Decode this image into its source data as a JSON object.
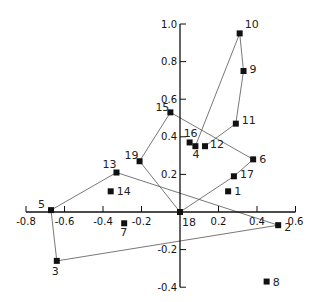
{
  "chart_data": {
    "type": "scatter",
    "title": "",
    "xlabel": "",
    "ylabel": "",
    "xlim": [
      -0.8,
      0.6
    ],
    "ylim": [
      -0.4,
      1.0
    ],
    "grid": false,
    "legend": null,
    "x_ticks": [
      -0.8,
      -0.6,
      -0.4,
      -0.2,
      0.2,
      0.4,
      0.6
    ],
    "x_tick_labels": [
      "-0.8",
      "-0.6",
      "-0.4",
      "-0.2",
      "0.2",
      "0.4",
      "0.6"
    ],
    "y_ticks": [
      1.0,
      0.8,
      0.6,
      0.4,
      0.2,
      -0.2,
      -0.4
    ],
    "y_tick_labels": [
      "1.0",
      "0.8",
      "0.6",
      "0.4",
      "0.2",
      "-0.2",
      "-0.4"
    ],
    "points": [
      {
        "id": "1",
        "x": 0.25,
        "y": 0.11
      },
      {
        "id": "2",
        "x": 0.51,
        "y": -0.07
      },
      {
        "id": "3",
        "x": -0.64,
        "y": -0.26
      },
      {
        "id": "4",
        "x": 0.08,
        "y": 0.35
      },
      {
        "id": "5",
        "x": -0.67,
        "y": 0.01
      },
      {
        "id": "6",
        "x": 0.38,
        "y": 0.28
      },
      {
        "id": "7",
        "x": -0.29,
        "y": -0.06
      },
      {
        "id": "8",
        "x": 0.45,
        "y": -0.37
      },
      {
        "id": "9",
        "x": 0.33,
        "y": 0.75
      },
      {
        "id": "10",
        "x": 0.31,
        "y": 0.95
      },
      {
        "id": "11",
        "x": 0.29,
        "y": 0.47
      },
      {
        "id": "12",
        "x": 0.13,
        "y": 0.35
      },
      {
        "id": "13",
        "x": -0.33,
        "y": 0.21
      },
      {
        "id": "14",
        "x": -0.36,
        "y": 0.11
      },
      {
        "id": "15",
        "x": -0.05,
        "y": 0.53
      },
      {
        "id": "16",
        "x": 0.05,
        "y": 0.37
      },
      {
        "id": "17",
        "x": 0.28,
        "y": 0.19
      },
      {
        "id": "18",
        "x": 0.0,
        "y": 0.0
      },
      {
        "id": "19",
        "x": -0.21,
        "y": 0.27
      }
    ],
    "paths": [
      [
        "12",
        "11",
        "9",
        "10",
        "4"
      ],
      [
        "18",
        "17",
        "6",
        "15",
        "19",
        "18"
      ],
      [
        "2",
        "13",
        "5",
        "3",
        "2"
      ]
    ]
  }
}
